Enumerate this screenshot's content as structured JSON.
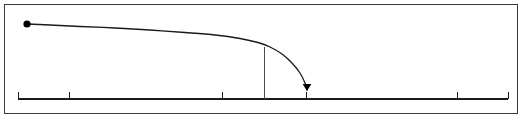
{
  "figure": {
    "title": "",
    "background_color": "#ffffff",
    "frame": {
      "name": "figure-border",
      "x": 4,
      "y": 4,
      "width": 514,
      "height": 110,
      "stroke": "#3a3a3a",
      "stroke_width": 1
    }
  },
  "chart_data": {
    "type": "line",
    "title": "",
    "subtitle": "",
    "xlabel": "",
    "ylabel": "",
    "grid": false,
    "legend": null,
    "legend_position": "none",
    "xlim": [
      18,
      508
    ],
    "ylim": [
      100,
      14
    ],
    "axis": {
      "name": "x-axis",
      "orientation": "horizontal",
      "baseline_y": 99,
      "x_start": 18,
      "x_end": 508,
      "stroke": "#1a1a1a",
      "stroke_width": 1.2,
      "tick_length": 7,
      "tick_direction": "up",
      "tick_positions": [
        18,
        69,
        222,
        264,
        306,
        457,
        508
      ],
      "tick_labels": [
        "",
        "",
        "",
        "",
        "",
        "",
        ""
      ]
    },
    "series": [
      {
        "name": "decay-curve",
        "type": "line",
        "stroke": "#1a1a1a",
        "stroke_width": 1.3,
        "start_marker": "filled-circle",
        "end_marker": "arrowhead-down",
        "x": [
          27,
          50,
          80,
          115,
          150,
          185,
          215,
          240,
          258,
          270,
          282,
          292,
          300,
          305,
          307
        ],
        "y": [
          24,
          25,
          26.5,
          28,
          30,
          32.5,
          35,
          38.5,
          42.5,
          47,
          54,
          63,
          73,
          83,
          90
        ]
      }
    ],
    "markers": [
      {
        "name": "start-point-dot",
        "shape": "filled-circle",
        "x": 27,
        "y": 24,
        "radius": 3.6,
        "color": "#000000"
      },
      {
        "name": "end-arrowhead",
        "shape": "arrowhead-down",
        "x": 307,
        "y": 90,
        "size": 7,
        "color": "#000000"
      }
    ],
    "annotations": [
      {
        "name": "threshold-vertical-line",
        "type": "vline",
        "x": 264,
        "y_top": 47,
        "y_bottom": 99,
        "stroke": "#4a4a4a",
        "stroke_width": 1.2,
        "label": ""
      }
    ]
  }
}
